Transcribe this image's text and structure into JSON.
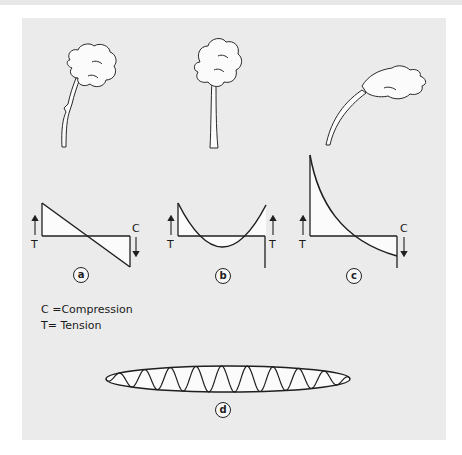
{
  "figure": {
    "panels": [
      {
        "id": "a",
        "label": "a",
        "tree": "wind-bent-broken",
        "diagram": "linear",
        "left_label": "T",
        "right_label": "C"
      },
      {
        "id": "b",
        "label": "b",
        "tree": "upright",
        "diagram": "parabolic",
        "left_label": "T",
        "right_label": "T"
      },
      {
        "id": "c",
        "label": "c",
        "tree": "wind-bent",
        "diagram": "exponential",
        "left_label": "T",
        "right_label": "C"
      },
      {
        "id": "d",
        "label": "d",
        "diagram": "oscillating-ellipse"
      }
    ],
    "legend": {
      "compression": "C =Compression",
      "tension": "T= Tension"
    }
  },
  "colors": {
    "background": "#ffffff",
    "panel": "#ebebeb",
    "stroke": "#1f1f1f",
    "fill": "#fbfbfb"
  }
}
